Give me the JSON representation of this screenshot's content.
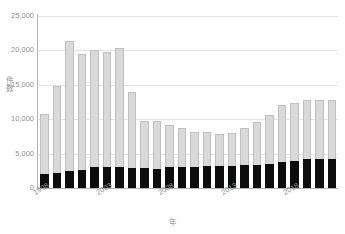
{
  "chart_data": {
    "type": "bar",
    "title": "",
    "subtitle": "",
    "xlabel": "年",
    "ylabel": "件数",
    "ylim": [
      0,
      25000
    ],
    "xlim_note": "1998-2021",
    "grid": true,
    "stacked": true,
    "legend_position": "none",
    "yticks": [
      "0",
      "5,000",
      "10,000",
      "15,000",
      "20,000",
      "25,000"
    ],
    "ytick_values": [
      0,
      5000,
      10000,
      15000,
      20000,
      25000
    ],
    "xticks_shown": [
      "1998",
      "2003",
      "2008",
      "2013",
      "2018"
    ],
    "categories": [
      "1998",
      "1999",
      "2000",
      "2001",
      "2002",
      "2003",
      "2004",
      "2005",
      "2006",
      "2007",
      "2008",
      "2009",
      "2010",
      "2011",
      "2012",
      "2013",
      "2014",
      "2015",
      "2016",
      "2017",
      "2018",
      "2019",
      "2020",
      "2021"
    ],
    "series": [
      {
        "name": "lower-segment",
        "color": "#0d0d0d",
        "values": [
          2000,
          2200,
          2500,
          2650,
          3000,
          3000,
          3000,
          2900,
          2850,
          2750,
          3050,
          3100,
          3050,
          3150,
          3250,
          3200,
          3350,
          3400,
          3500,
          3800,
          3950,
          4150,
          4150,
          4150
        ]
      },
      {
        "name": "upper-segment",
        "color": "#d9d9d9",
        "values": [
          8800,
          12600,
          18800,
          16850,
          17100,
          16700,
          17300,
          11000,
          6950,
          7000,
          6050,
          5600,
          5150,
          4950,
          4650,
          4750,
          5350,
          6200,
          7050,
          8300,
          8400,
          8600,
          8600,
          8600
        ]
      }
    ],
    "totals": [
      10800,
      14800,
      21300,
      19500,
      20100,
      19700,
      20300,
      13900,
      9800,
      9750,
      9100,
      8700,
      8200,
      8100,
      7900,
      7950,
      8700,
      9600,
      10550,
      12100,
      12350,
      12750,
      12750,
      12750
    ]
  }
}
